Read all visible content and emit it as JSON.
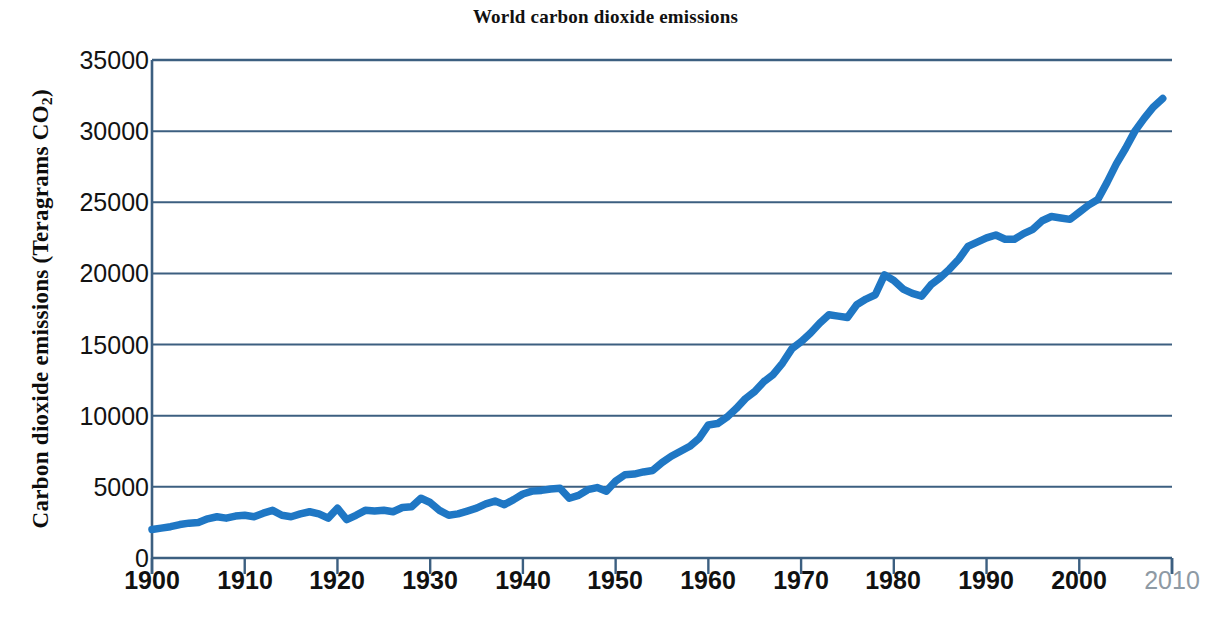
{
  "chart_data": {
    "type": "line",
    "title": "World carbon dioxide emissions",
    "xlabel": "",
    "ylabel": "Carbon dioxide emissions (Teragrams CO2)",
    "ylabel_prefix": "Carbon dioxide emissions (Teragrams CO",
    "ylabel_subscript": "2",
    "ylabel_suffix": ")",
    "xlim": [
      1900,
      2010
    ],
    "ylim": [
      0,
      35000
    ],
    "grid": true,
    "legend": "none",
    "series_color": "#1f77c4",
    "axis_color": "#3c5f80",
    "y_ticks": [
      0,
      5000,
      10000,
      15000,
      20000,
      25000,
      30000,
      35000
    ],
    "y_tick_labels": [
      "0",
      "5000",
      "10000",
      "15000",
      "20000",
      "25000",
      "30000",
      "35000"
    ],
    "x_ticks": [
      1900,
      1910,
      1920,
      1930,
      1940,
      1950,
      1960,
      1970,
      1980,
      1990,
      2000,
      2010
    ],
    "x_tick_labels": [
      "1900",
      "1910",
      "1920",
      "1930",
      "1940",
      "1950",
      "1960",
      "1970",
      "1980",
      "1990",
      "2000",
      "2010"
    ],
    "x_tick_muted_index": 11,
    "series": [
      {
        "name": "World CO2 emissions",
        "x": [
          1900,
          1901,
          1902,
          1903,
          1904,
          1905,
          1906,
          1907,
          1908,
          1909,
          1910,
          1911,
          1912,
          1913,
          1914,
          1915,
          1916,
          1917,
          1918,
          1919,
          1920,
          1921,
          1922,
          1923,
          1924,
          1925,
          1926,
          1927,
          1928,
          1929,
          1930,
          1931,
          1932,
          1933,
          1934,
          1935,
          1936,
          1937,
          1938,
          1939,
          1940,
          1941,
          1942,
          1943,
          1944,
          1945,
          1946,
          1947,
          1948,
          1949,
          1950,
          1951,
          1952,
          1953,
          1954,
          1955,
          1956,
          1957,
          1958,
          1959,
          1960,
          1961,
          1962,
          1963,
          1964,
          1965,
          1966,
          1967,
          1968,
          1969,
          1970,
          1971,
          1972,
          1973,
          1974,
          1975,
          1976,
          1977,
          1978,
          1979,
          1980,
          1981,
          1982,
          1983,
          1984,
          1985,
          1986,
          1987,
          1988,
          1989,
          1990,
          1991,
          1992,
          1993,
          1994,
          1995,
          1996,
          1997,
          1998,
          1999,
          2000,
          2001,
          2002,
          2003,
          2004,
          2005,
          2006,
          2007,
          2008,
          2009
        ],
        "values": [
          2000,
          2100,
          2200,
          2350,
          2450,
          2500,
          2750,
          2900,
          2800,
          2950,
          3000,
          2900,
          3150,
          3350,
          3000,
          2900,
          3100,
          3250,
          3100,
          2800,
          3500,
          2700,
          3000,
          3350,
          3300,
          3350,
          3250,
          3550,
          3600,
          4200,
          3900,
          3350,
          3000,
          3100,
          3300,
          3500,
          3800,
          4000,
          3750,
          4100,
          4500,
          4700,
          4750,
          4850,
          4900,
          4200,
          4400,
          4800,
          4950,
          4700,
          5400,
          5850,
          5900,
          6050,
          6150,
          6700,
          7150,
          7500,
          7850,
          8400,
          9350,
          9450,
          9900,
          10500,
          11200,
          11700,
          12400,
          12900,
          13700,
          14700,
          15200,
          15800,
          16500,
          17100,
          17000,
          16900,
          17800,
          18200,
          18500,
          19900,
          19500,
          18900,
          18600,
          18400,
          19200,
          19700,
          20300,
          21000,
          21900,
          22200,
          22500,
          22700,
          22400,
          22400,
          22800,
          23100,
          23700,
          24000,
          23900,
          23800,
          24300,
          24800,
          25200,
          26400,
          27700,
          28800,
          30000,
          30900,
          31700,
          32300
        ]
      }
    ],
    "annotations": []
  }
}
